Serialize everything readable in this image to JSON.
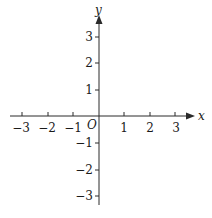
{
  "figure": {
    "origin_label": "O",
    "x_axis": {
      "label": "x",
      "ticks": [
        {
          "value": -3,
          "label": "−3"
        },
        {
          "value": -2,
          "label": "−2"
        },
        {
          "value": -1,
          "label": "−1"
        },
        {
          "value": 1,
          "label": "1"
        },
        {
          "value": 2,
          "label": "2"
        },
        {
          "value": 3,
          "label": "3"
        }
      ]
    },
    "y_axis": {
      "label": "y",
      "ticks": [
        {
          "value": 3,
          "label": "3"
        },
        {
          "value": 2,
          "label": "2"
        },
        {
          "value": 1,
          "label": "1"
        },
        {
          "value": -1,
          "label": "−1"
        },
        {
          "value": -2,
          "label": "−2"
        },
        {
          "value": -3,
          "label": "−3"
        }
      ]
    },
    "colors": {
      "axis": "#2a2a2a",
      "background": "#ffffff"
    }
  }
}
